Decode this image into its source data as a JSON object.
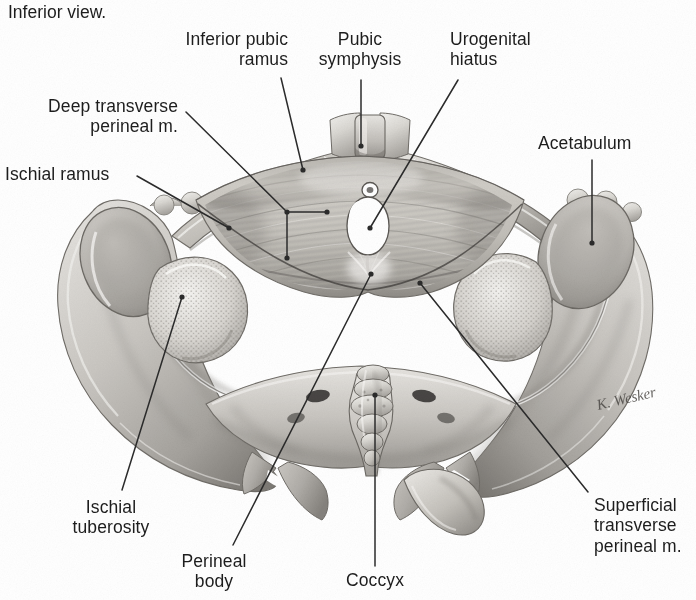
{
  "figure": {
    "caption": "Inferior view.",
    "signature": "K. Wesker",
    "view_type": "inferior view of female bony pelvis with perineal muscles",
    "background_color": "#ffffff",
    "label_color": "#1d1d1d",
    "leader_color": "#2b2b2b"
  },
  "labels": [
    {
      "id": "inferior-pubic-ramus",
      "lines": [
        "Inferior pubic",
        "ramus"
      ],
      "text": "Inferior pubic ramus",
      "align": "right",
      "x": 288,
      "y": 29,
      "leader": [
        [
          281,
          78
        ],
        [
          303,
          170
        ]
      ],
      "dot_end": true
    },
    {
      "id": "pubic-symphysis",
      "lines": [
        "Pubic",
        "symphysis"
      ],
      "text": "Pubic symphysis",
      "align": "center",
      "x": 360,
      "y": 29,
      "leader": [
        [
          361,
          80
        ],
        [
          361,
          146
        ]
      ],
      "dot_end": true
    },
    {
      "id": "urogenital-hiatus",
      "lines": [
        "Urogenital",
        "hiatus"
      ],
      "text": "Urogenital hiatus",
      "align": "left",
      "x": 450,
      "y": 29,
      "leader": [
        [
          458,
          80
        ],
        [
          370,
          228
        ]
      ],
      "dot_end": true
    },
    {
      "id": "deep-transverse-perineal-m",
      "lines": [
        "Deep transverse",
        "perineal m."
      ],
      "text": "Deep transverse perineal m.",
      "align": "right",
      "x": 178,
      "y": 96,
      "leader": [
        [
          186,
          112
        ],
        [
          287,
          212
        ]
      ],
      "branches": [
        [
          [
            287,
            212
          ],
          [
            327,
            212
          ]
        ],
        [
          [
            287,
            212
          ],
          [
            287,
            258
          ]
        ]
      ],
      "dot_end": true
    },
    {
      "id": "acetabulum",
      "lines": [
        "Acetabulum"
      ],
      "text": "Acetabulum",
      "align": "left",
      "x": 538,
      "y": 133,
      "leader": [
        [
          592,
          160
        ],
        [
          592,
          243
        ]
      ],
      "dot_end": true
    },
    {
      "id": "ischial-ramus",
      "lines": [
        "Ischial ramus"
      ],
      "text": "Ischial ramus",
      "align": "left",
      "x": 5,
      "y": 164,
      "leader": [
        [
          137,
          176
        ],
        [
          229,
          228
        ]
      ],
      "dot_end": true
    },
    {
      "id": "ischial-tuberosity",
      "lines": [
        "Ischial",
        "tuberosity"
      ],
      "text": "Ischial tuberosity",
      "align": "center",
      "x": 111,
      "y": 497,
      "leader": [
        [
          122,
          490
        ],
        [
          182,
          297
        ]
      ],
      "dot_end": true
    },
    {
      "id": "perineal-body",
      "lines": [
        "Perineal",
        "body"
      ],
      "text": "Perineal body",
      "align": "center",
      "x": 214,
      "y": 551,
      "leader": [
        [
          233,
          545
        ],
        [
          371,
          274
        ]
      ],
      "dot_end": true
    },
    {
      "id": "coccyx",
      "lines": [
        "Coccyx"
      ],
      "text": "Coccyx",
      "align": "center",
      "x": 375,
      "y": 570,
      "leader": [
        [
          375,
          566
        ],
        [
          375,
          395
        ]
      ],
      "dot_end": true
    },
    {
      "id": "superficial-transverse-perineal-m",
      "lines": [
        "Superficial",
        "transverse",
        "perineal m."
      ],
      "text": "Superficial transverse perineal m.",
      "align": "left",
      "x": 594,
      "y": 495,
      "leader": [
        [
          588,
          492
        ],
        [
          420,
          283
        ]
      ],
      "dot_end": true
    }
  ],
  "structures": [
    {
      "id": "urethral-opening",
      "name": "external urethral orifice",
      "cx": 370,
      "cy": 190,
      "rx": 7,
      "ry": 6.5
    },
    {
      "id": "vaginal-opening",
      "name": "vaginal orifice / urogenital hiatus",
      "cx": 368,
      "cy": 226,
      "rx": 19,
      "ry": 27
    },
    {
      "id": "pubic-symphysis-body",
      "name": "pubic symphysis",
      "cx": 361,
      "cy": 140
    },
    {
      "id": "sacral-foramina",
      "name": "sacral foramina",
      "count": 4
    },
    {
      "id": "coccyx-body",
      "name": "coccyx",
      "cx": 375,
      "cy": 400
    },
    {
      "id": "left-ischial-tuberosity",
      "name": "ischial tuberosity (left)",
      "cx": 185,
      "cy": 300
    },
    {
      "id": "right-ischial-tuberosity",
      "name": "ischial tuberosity (right)",
      "cx": 540,
      "cy": 280
    },
    {
      "id": "left-acetabulum",
      "name": "acetabulum (left)",
      "cx": 120,
      "cy": 250
    },
    {
      "id": "right-acetabulum",
      "name": "acetabulum (right)",
      "cx": 592,
      "cy": 243
    }
  ]
}
